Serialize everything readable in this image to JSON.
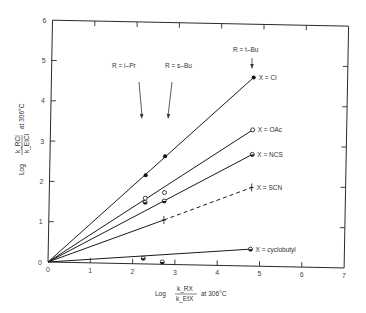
{
  "chart_data": {
    "type": "scatter",
    "title": "",
    "xlabel": {
      "prefix": "Log",
      "numerator": "k_RX",
      "denominator": "k_EtX",
      "suffix": "at 306°C"
    },
    "ylabel": {
      "prefix": "Log",
      "numerator": "k_RCl",
      "denominator": "k_EtCl",
      "suffix": "at 306°C"
    },
    "xlim": [
      0,
      7
    ],
    "ylim": [
      0,
      6
    ],
    "x_ticks": [
      0,
      1,
      2,
      3,
      4,
      5,
      6,
      7
    ],
    "y_ticks": [
      0,
      1,
      2,
      3,
      4,
      5,
      6
    ],
    "grid": false,
    "legend": "inline labels at line ends",
    "series": [
      {
        "name": "X = Cl",
        "marker": "filled",
        "line": "solid",
        "points": [
          {
            "x": 0,
            "y": 0
          },
          {
            "x": 2.27,
            "y": 2.2
          },
          {
            "x": 2.72,
            "y": 2.68
          },
          {
            "x": 4.78,
            "y": 4.68
          }
        ]
      },
      {
        "name": "X = OAc",
        "marker": "open",
        "line": "solid",
        "points": [
          {
            "x": 0,
            "y": 0
          },
          {
            "x": 2.27,
            "y": 1.63
          },
          {
            "x": 2.72,
            "y": 1.78
          },
          {
            "x": 4.78,
            "y": 3.38
          }
        ]
      },
      {
        "name": "X = NCS",
        "marker": "half",
        "line": "solid",
        "points": [
          {
            "x": 0,
            "y": 0
          },
          {
            "x": 2.27,
            "y": 1.53
          },
          {
            "x": 2.72,
            "y": 1.57
          },
          {
            "x": 4.78,
            "y": 2.77
          }
        ]
      },
      {
        "name": "X = SCN",
        "marker": "cross",
        "line": "solid-then-dashed",
        "points": [
          {
            "x": 0,
            "y": 0
          },
          {
            "x": 2.72,
            "y": 1.1
          },
          {
            "x": 4.78,
            "y": 1.95
          }
        ]
      },
      {
        "name": "X = cyclobutyl",
        "marker": "half",
        "line": "solid",
        "points": [
          {
            "x": 0,
            "y": 0
          },
          {
            "x": 2.25,
            "y": 0.14
          },
          {
            "x": 2.7,
            "y": 0.06
          },
          {
            "x": 4.78,
            "y": 0.42
          }
        ]
      }
    ],
    "annotations": [
      {
        "text": "R = i–Pr",
        "arrow_to_x": 2.27
      },
      {
        "text": "R = s–Bu",
        "arrow_to_x": 2.72
      },
      {
        "text": "R = t–Bu",
        "arrow_to_x": 4.78
      }
    ]
  }
}
